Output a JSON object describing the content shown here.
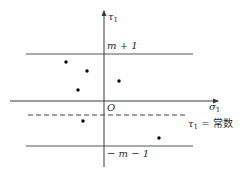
{
  "diagram": {
    "axes": {
      "x_label": "σ",
      "x_label_sub": "1",
      "y_label": "τ",
      "y_label_sub": "1",
      "origin_label": "O"
    },
    "lines": {
      "upper": {
        "label": "m + 1"
      },
      "lower": {
        "label": "− m − 1"
      },
      "dashed": {
        "label_var": "τ",
        "label_sub": "1",
        "label_rest": " = 常数"
      }
    },
    "points": [
      {
        "x": 66,
        "y": 62
      },
      {
        "x": 87,
        "y": 71
      },
      {
        "x": 78,
        "y": 90
      },
      {
        "x": 119,
        "y": 81
      },
      {
        "x": 83,
        "y": 121
      },
      {
        "x": 159,
        "y": 138
      }
    ],
    "colors": {
      "line": "#3a3a3a",
      "point": "#000000",
      "text": "#2a2a2a"
    }
  }
}
